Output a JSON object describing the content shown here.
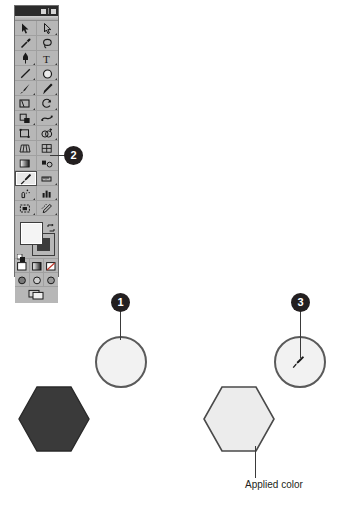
{
  "app": {
    "panel_title": "Tools",
    "window_buttons": [
      "minimize",
      "close"
    ]
  },
  "toolbox": {
    "tools": [
      {
        "id": "selection",
        "icon": "selection-arrow-icon",
        "selected": false,
        "flyout": false
      },
      {
        "id": "direct-selection",
        "icon": "direct-selection-arrow-icon",
        "selected": false,
        "flyout": true
      },
      {
        "id": "magic-wand",
        "icon": "magic-wand-icon",
        "selected": false,
        "flyout": false
      },
      {
        "id": "lasso",
        "icon": "lasso-icon",
        "selected": false,
        "flyout": false
      },
      {
        "id": "pen",
        "icon": "pen-icon",
        "selected": false,
        "flyout": true
      },
      {
        "id": "type",
        "icon": "type-tool-icon",
        "selected": false,
        "flyout": true
      },
      {
        "id": "line-segment",
        "icon": "line-segment-icon",
        "selected": false,
        "flyout": true
      },
      {
        "id": "ellipse",
        "icon": "ellipse-shape-icon",
        "selected": false,
        "flyout": true
      },
      {
        "id": "paintbrush",
        "icon": "paintbrush-icon",
        "selected": false,
        "flyout": true
      },
      {
        "id": "pencil",
        "icon": "pencil-icon",
        "selected": false,
        "flyout": true
      },
      {
        "id": "eraser",
        "icon": "eraser-icon",
        "selected": false,
        "flyout": true
      },
      {
        "id": "rotate",
        "icon": "rotate-icon",
        "selected": false,
        "flyout": true
      },
      {
        "id": "scale",
        "icon": "scale-icon",
        "selected": false,
        "flyout": true
      },
      {
        "id": "warp",
        "icon": "warp-icon",
        "selected": false,
        "flyout": true
      },
      {
        "id": "free-transform",
        "icon": "free-transform-icon",
        "selected": false,
        "flyout": false
      },
      {
        "id": "shape-builder",
        "icon": "shape-builder-icon",
        "selected": false,
        "flyout": true
      },
      {
        "id": "perspective-grid",
        "icon": "perspective-grid-icon",
        "selected": false,
        "flyout": false
      },
      {
        "id": "mesh",
        "icon": "mesh-icon",
        "selected": false,
        "flyout": false
      },
      {
        "id": "gradient",
        "icon": "gradient-icon",
        "selected": false,
        "flyout": false
      },
      {
        "id": "eyedropper",
        "icon": "eyedropper-icon",
        "selected": true,
        "flyout": false
      },
      {
        "id": "blend",
        "icon": "blend-icon",
        "selected": false,
        "flyout": true
      },
      {
        "id": "symbol-sprayer",
        "icon": "symbol-sprayer-icon",
        "selected": false,
        "flyout": true
      },
      {
        "id": "column-graph",
        "icon": "column-graph-icon",
        "selected": false,
        "flyout": true
      },
      {
        "id": "artboard",
        "icon": "artboard-icon",
        "selected": false,
        "flyout": false
      },
      {
        "id": "slice",
        "icon": "slice-icon",
        "selected": false,
        "flyout": true
      },
      {
        "id": "hand",
        "icon": "hand-icon",
        "selected": false,
        "flyout": true
      },
      {
        "id": "zoom",
        "icon": "zoom-magnifier-icon",
        "selected": false,
        "flyout": false
      }
    ],
    "color_controls": {
      "fill_label": "Fill",
      "fill_color": "#f4f4f4",
      "stroke_label": "Stroke",
      "stroke_color": "#3c3c3c",
      "swap_icon": "swap-fill-stroke-icon",
      "default_icon": "default-fill-stroke-icon"
    },
    "paint_modes": [
      {
        "id": "color",
        "icon": "color-mode-icon"
      },
      {
        "id": "gradient",
        "icon": "gradient-mode-icon"
      },
      {
        "id": "none",
        "icon": "none-mode-icon"
      }
    ],
    "draw_modes": [
      {
        "id": "draw-normal",
        "icon": "draw-normal-icon"
      },
      {
        "id": "draw-behind",
        "icon": "draw-behind-icon"
      },
      {
        "id": "draw-inside",
        "icon": "draw-inside-icon"
      }
    ],
    "screen_mode": {
      "id": "change-screen-mode",
      "icon": "change-screen-mode-icon"
    }
  },
  "callouts": [
    {
      "number": "1",
      "target": "source-circle"
    },
    {
      "number": "2",
      "target": "eyedropper-tool"
    },
    {
      "number": "3",
      "target": "sampled-circle"
    }
  ],
  "artwork": {
    "circle_source": {
      "fill": "#f2f2f2",
      "stroke": "#5a5a5a"
    },
    "circle_sampled": {
      "fill": "#f2f2f2",
      "stroke": "#5a5a5a",
      "cursor": "eyedropper-cursor-icon"
    },
    "hexagon_left": {
      "fill": "#3a3a3a",
      "stroke": "#2a2a2a"
    },
    "hexagon_right": {
      "fill": "#ececec",
      "stroke": "#4a4a4a"
    }
  },
  "annotations": {
    "applied_color_label": "Applied color"
  }
}
